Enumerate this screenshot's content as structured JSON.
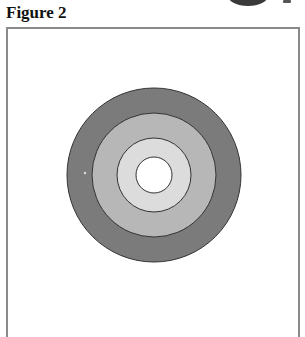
{
  "header": {
    "title": "Figure 2"
  },
  "diagram": {
    "type": "concentric-circles",
    "center": [
      154,
      175
    ],
    "rings": [
      {
        "name": "outer-ring",
        "radius": 87,
        "fill": "#7b7b7b"
      },
      {
        "name": "second-ring",
        "radius": 62,
        "fill": "#b7b7b7"
      },
      {
        "name": "third-ring",
        "radius": 37,
        "fill": "#dcdcdc"
      },
      {
        "name": "center-circle",
        "radius": 18,
        "fill": "#ffffff"
      }
    ],
    "stroke": "#333333"
  }
}
